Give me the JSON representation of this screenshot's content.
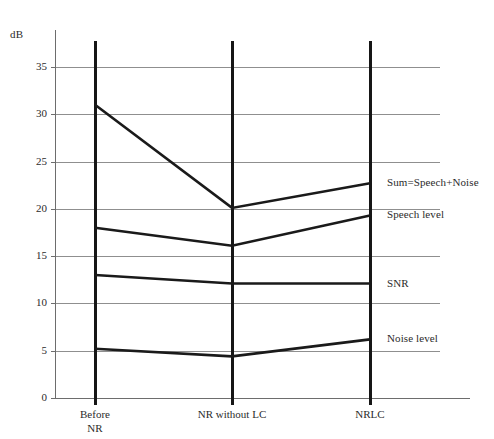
{
  "chart_data": {
    "type": "line",
    "title": "",
    "subtitle": "",
    "xlabel": "",
    "ylabel": "dB",
    "ylim": [
      0,
      37.5
    ],
    "xlim": [
      0,
      2
    ],
    "grid": true,
    "legend_position": "right-inline",
    "categories": [
      "Before\nNR",
      "NR without LC",
      "NRLC"
    ],
    "category_labels": [
      {
        "line1": "Before",
        "line2": "NR"
      },
      {
        "line1": "NR without LC",
        "line2": ""
      },
      {
        "line1": "NRLC",
        "line2": ""
      }
    ],
    "yticks": [
      0,
      5,
      10,
      15,
      20,
      25,
      30,
      35
    ],
    "ytick_labels": [
      "0",
      "5",
      "10",
      "15",
      "20",
      "25",
      "30",
      "35"
    ],
    "series": [
      {
        "name": "Sum=Speech+Noise",
        "values": [
          31.0,
          20.1,
          22.7
        ],
        "color": "#1a1a1a"
      },
      {
        "name": "Speech level",
        "values": [
          18.0,
          16.1,
          19.3
        ],
        "color": "#1a1a1a"
      },
      {
        "name": "SNR",
        "values": [
          13.0,
          12.1,
          12.1
        ],
        "color": "#1a1a1a"
      },
      {
        "name": "Noise level",
        "values": [
          5.2,
          4.4,
          6.2
        ],
        "color": "#1a1a1a"
      }
    ],
    "series_label_y": [
      22.7,
      19.3,
      12.1,
      6.2
    ],
    "axis_color": "#6d6d6d",
    "grid_color": "#8f8f8f",
    "line_color": "#1a1a1a",
    "column_rule_color": "#161616"
  }
}
